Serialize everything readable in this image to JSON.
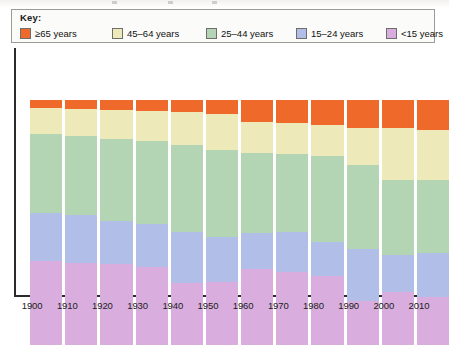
{
  "key": {
    "title": "Key:",
    "items": [
      {
        "label": "≥65 years",
        "color": "#ef6a2a",
        "name": "65-plus"
      },
      {
        "label": "45–64 years",
        "color": "#eee9b8",
        "name": "45-64"
      },
      {
        "label": "25–44 years",
        "color": "#b4d5b4",
        "name": "25-44"
      },
      {
        "label": "15–24 years",
        "color": "#b0bee8",
        "name": "15-24"
      },
      {
        "label": "<15 years",
        "color": "#d9aede",
        "name": "under-15"
      }
    ]
  },
  "chart_data": {
    "type": "bar",
    "stacked": true,
    "title": "",
    "xlabel": "",
    "ylabel": "",
    "ylim": [
      0,
      100
    ],
    "grid": false,
    "legend_position": "top",
    "categories": [
      "1900",
      "1910",
      "1920",
      "1930",
      "1940",
      "1950",
      "1960",
      "1970",
      "1980",
      "1990",
      "2000",
      "2010"
    ],
    "series": [
      {
        "name": "≥65 years",
        "color": "#ef6a2a",
        "values": [
          3.3,
          3.7,
          4.1,
          4.5,
          5.0,
          5.7,
          9.0,
          9.4,
          10.2,
          11.4,
          11.4,
          12.2
        ]
      },
      {
        "name": "45–64 years",
        "color": "#eee9b8",
        "values": [
          10.6,
          11.0,
          11.8,
          12.2,
          13.5,
          14.7,
          12.7,
          12.7,
          12.7,
          15.1,
          21.2,
          20.4
        ]
      },
      {
        "name": "25–44 years",
        "color": "#b4d5b4",
        "values": [
          32.2,
          32.2,
          33.5,
          33.9,
          35.5,
          35.5,
          32.7,
          31.8,
          35.1,
          34.3,
          30.6,
          29.8
        ]
      },
      {
        "name": "15–24 years",
        "color": "#b0bee8",
        "values": [
          19.6,
          19.6,
          17.6,
          17.6,
          20.8,
          18.4,
          14.7,
          16.3,
          13.9,
          21.2,
          15.1,
          18.0
        ]
      },
      {
        "name": "<15 years",
        "color": "#d9aede",
        "values": [
          34.3,
          33.5,
          33.1,
          31.8,
          25.3,
          25.7,
          31.0,
          29.8,
          28.2,
          18.0,
          21.6,
          19.6
        ]
      }
    ]
  }
}
